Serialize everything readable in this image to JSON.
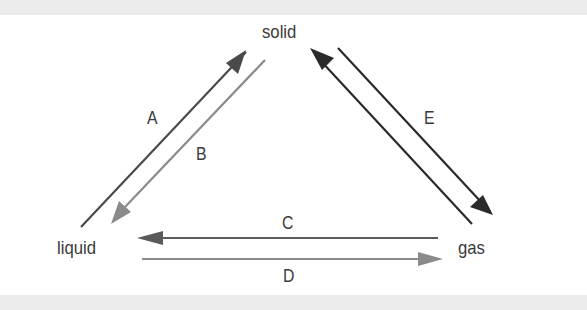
{
  "diagram": {
    "nodes": [
      {
        "id": "solid",
        "label": "solid"
      },
      {
        "id": "liquid",
        "label": "liquid"
      },
      {
        "id": "gas",
        "label": "gas"
      }
    ],
    "edges": [
      {
        "label": "A",
        "from": "liquid",
        "to": "solid",
        "color": "#4a4a4a"
      },
      {
        "label": "B",
        "from": "solid",
        "to": "liquid",
        "color": "#8a8a8a"
      },
      {
        "label": "C",
        "from": "gas",
        "to": "liquid",
        "color": "#5a5a5a"
      },
      {
        "label": "D",
        "from": "liquid",
        "to": "gas",
        "color": "#8a8a8a"
      },
      {
        "label": "E",
        "from": "solid",
        "to": "gas",
        "color": "#2a2a2a"
      },
      {
        "label": "",
        "from": "gas",
        "to": "solid",
        "color": "#2a2a2a"
      }
    ]
  }
}
